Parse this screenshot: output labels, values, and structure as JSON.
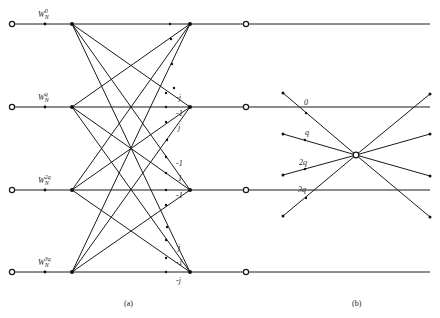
{
  "diagram_a": {
    "caption": "(a)",
    "input_labels": [
      {
        "base": "W",
        "sub": "N",
        "sup": "0"
      },
      {
        "base": "W",
        "sub": "N",
        "sup": "q"
      },
      {
        "base": "W",
        "sub": "N",
        "sup": "2q"
      },
      {
        "base": "W",
        "sub": "N",
        "sup": "3q"
      }
    ],
    "branch_labels": [
      {
        "text": "-j",
        "x": 176,
        "y": 100
      },
      {
        "text": "-1",
        "x": 176,
        "y": 116
      },
      {
        "text": "j",
        "x": 178,
        "y": 130
      },
      {
        "text": "-1",
        "x": 176,
        "y": 166
      },
      {
        "text": "1",
        "x": 178,
        "y": 181
      },
      {
        "text": "-1",
        "x": 176,
        "y": 198
      },
      {
        "text": "j",
        "x": 178,
        "y": 250
      },
      {
        "text": "-1",
        "x": 176,
        "y": 265
      },
      {
        "text": "-j",
        "x": 176,
        "y": 283
      }
    ]
  },
  "diagram_b": {
    "caption": "(b)",
    "input_labels": [
      "0",
      "q",
      "2q",
      "3q"
    ]
  },
  "colors": {
    "line": "#1a1a1a",
    "background": "#ffffff"
  }
}
